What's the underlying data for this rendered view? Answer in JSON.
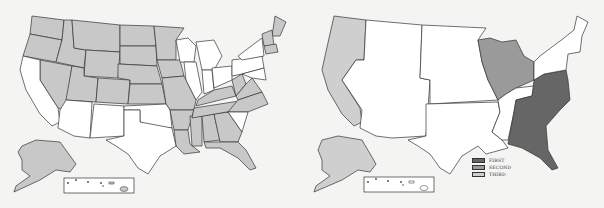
{
  "maps": [
    {
      "id": "left",
      "description": "United States map with shaded states",
      "shaded_color": "#c8c8c8",
      "unshaded_color": "#ffffff",
      "shaded_states": [
        "WA",
        "OR",
        "ID",
        "MT",
        "WY",
        "NV",
        "UT",
        "CO",
        "ND",
        "SD",
        "NE",
        "KS",
        "MN",
        "IA",
        "MO",
        "AR",
        "LA",
        "MS",
        "AL",
        "GA",
        "FL",
        "TN",
        "KY",
        "WV",
        "VA",
        "NC",
        "ME",
        "NH",
        "VT",
        "MA",
        "CT",
        "RI",
        "AK"
      ],
      "unshaded_states": [
        "CA",
        "AZ",
        "NM",
        "TX",
        "OK",
        "WI",
        "IL",
        "MI",
        "IN",
        "OH",
        "PA",
        "NY",
        "NJ",
        "DE",
        "MD",
        "SC",
        "HI"
      ]
    },
    {
      "id": "right",
      "description": "United States map with regions ranked",
      "regions": [
        {
          "rank": "FIRST",
          "color": "#666666",
          "area": "Southeast Atlantic (VA, NC, SC, GA, FL, TN-east, AL, KY-east, WV, MD)"
        },
        {
          "rank": "SECOND",
          "color": "#9a9a9a",
          "area": "Great Lakes (WI, MI, IL, IN, OH)"
        },
        {
          "rank": "THIRD",
          "color": "#cfcfcf",
          "area": "Pacific (WA, OR, CA, AK)"
        }
      ]
    }
  ],
  "legend": {
    "items": [
      {
        "label": "FIRST",
        "color": "#666666"
      },
      {
        "label": "SECOND",
        "color": "#9a9a9a"
      },
      {
        "label": "THIRD",
        "color": "#cfcfcf"
      }
    ]
  },
  "colors": {
    "background": "#f4f4f2",
    "stroke": "#333333"
  }
}
